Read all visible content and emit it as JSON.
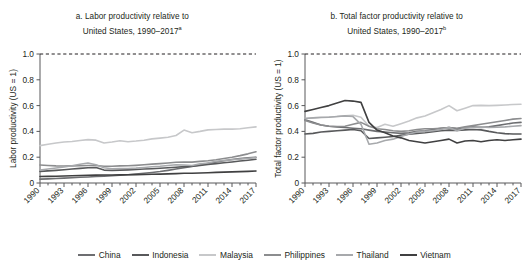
{
  "figure": {
    "background": "#ffffff",
    "axis_color": "#58595b",
    "reference_line_label": "US = 1 reference (dashed at 1.0)"
  },
  "legend": {
    "position": "bottom-center",
    "items": [
      {
        "label": "China",
        "color": "#6d6e71"
      },
      {
        "label": "Indonesia",
        "color": "#58595b"
      },
      {
        "label": "Malaysia",
        "color": "#c7c8ca"
      },
      {
        "label": "Philippines",
        "color": "#8c8d8f"
      },
      {
        "label": "Thailand",
        "color": "#a7a9ac"
      },
      {
        "label": "Vietnam",
        "color": "#404041"
      }
    ]
  },
  "chart_data": [
    {
      "type": "line",
      "panel": "a",
      "title": "a. Labor productivity relative to United States, 1990–2017",
      "title_line1": "a. Labor productivity relative to",
      "title_line2": "United States, 1990–2017",
      "footnote_marker": "a",
      "xlabel": "",
      "ylabel": "Labor productivity (US = 1)",
      "ylim": [
        0,
        1.0
      ],
      "yticks": [
        0,
        0.2,
        0.4,
        0.6,
        0.8,
        1.0
      ],
      "ytick_labels": [
        "0",
        "0.2",
        "0.4",
        "0.6",
        "0.8",
        "1.0"
      ],
      "xlim": [
        1990,
        2017
      ],
      "xticks": [
        1990,
        1993,
        1996,
        1999,
        2002,
        2005,
        2008,
        2011,
        2014,
        2017
      ],
      "xtick_labels": [
        "1990",
        "1993",
        "1996",
        "1999",
        "2002",
        "2005",
        "2008",
        "2011",
        "2014",
        "2017"
      ],
      "grid": false,
      "reference_line": {
        "value": 1.0,
        "style": "dashed",
        "color": "#231f20"
      },
      "x": [
        1990,
        1991,
        1992,
        1993,
        1994,
        1995,
        1996,
        1997,
        1998,
        1999,
        2000,
        2001,
        2002,
        2003,
        2004,
        2005,
        2006,
        2007,
        2008,
        2009,
        2010,
        2011,
        2012,
        2013,
        2014,
        2015,
        2016,
        2017
      ],
      "series": [
        {
          "name": "China",
          "color": "#6d6e71",
          "values": [
            0.03,
            0.032,
            0.035,
            0.038,
            0.041,
            0.044,
            0.047,
            0.05,
            0.053,
            0.056,
            0.06,
            0.064,
            0.069,
            0.075,
            0.082,
            0.089,
            0.098,
            0.108,
            0.118,
            0.128,
            0.14,
            0.152,
            0.163,
            0.173,
            0.182,
            0.189,
            0.195,
            0.2
          ]
        },
        {
          "name": "Indonesia",
          "color": "#58595b",
          "values": [
            0.09,
            0.094,
            0.098,
            0.103,
            0.108,
            0.113,
            0.118,
            0.12,
            0.1,
            0.098,
            0.1,
            0.102,
            0.105,
            0.108,
            0.111,
            0.114,
            0.118,
            0.122,
            0.127,
            0.131,
            0.137,
            0.143,
            0.15,
            0.157,
            0.163,
            0.17,
            0.177,
            0.184
          ]
        },
        {
          "name": "Malaysia",
          "color": "#c7c8ca",
          "values": [
            0.29,
            0.3,
            0.31,
            0.318,
            0.322,
            0.33,
            0.336,
            0.332,
            0.31,
            0.318,
            0.328,
            0.32,
            0.325,
            0.332,
            0.342,
            0.348,
            0.355,
            0.368,
            0.41,
            0.39,
            0.4,
            0.412,
            0.415,
            0.418,
            0.418,
            0.42,
            0.428,
            0.435
          ]
        },
        {
          "name": "Philippines",
          "color": "#8c8d8f",
          "values": [
            0.14,
            0.136,
            0.133,
            0.132,
            0.133,
            0.134,
            0.136,
            0.136,
            0.13,
            0.13,
            0.133,
            0.134,
            0.137,
            0.141,
            0.146,
            0.15,
            0.155,
            0.161,
            0.163,
            0.162,
            0.168,
            0.172,
            0.18,
            0.19,
            0.2,
            0.212,
            0.226,
            0.242
          ]
        },
        {
          "name": "Thailand",
          "color": "#a7a9ac",
          "values": [
            0.1,
            0.108,
            0.116,
            0.124,
            0.134,
            0.145,
            0.155,
            0.142,
            0.118,
            0.11,
            0.112,
            0.112,
            0.115,
            0.12,
            0.126,
            0.13,
            0.136,
            0.142,
            0.14,
            0.136,
            0.148,
            0.155,
            0.168,
            0.175,
            0.18,
            0.186,
            0.192,
            0.198
          ]
        },
        {
          "name": "Vietnam",
          "color": "#404041",
          "values": [
            0.05,
            0.051,
            0.052,
            0.054,
            0.056,
            0.058,
            0.06,
            0.061,
            0.062,
            0.062,
            0.063,
            0.064,
            0.065,
            0.066,
            0.068,
            0.069,
            0.071,
            0.073,
            0.075,
            0.076,
            0.078,
            0.08,
            0.082,
            0.084,
            0.086,
            0.088,
            0.09,
            0.093
          ]
        }
      ]
    },
    {
      "type": "line",
      "panel": "b",
      "title": "b. Total factor productivity relative to United States, 1990–2017",
      "title_line1": "b. Total factor productivity relative to",
      "title_line2": "United States, 1990–2017",
      "footnote_marker": "b",
      "xlabel": "",
      "ylabel": "Total factor productivity (US = 1)",
      "ylim": [
        0,
        1.0
      ],
      "yticks": [
        0,
        0.2,
        0.4,
        0.6,
        0.8,
        1.0
      ],
      "ytick_labels": [
        "0",
        "0.2",
        "0.4",
        "0.6",
        "0.8",
        "1.0"
      ],
      "xlim": [
        1990,
        2017
      ],
      "xticks": [
        1990,
        1993,
        1996,
        1999,
        2002,
        2005,
        2008,
        2011,
        2014,
        2017
      ],
      "xtick_labels": [
        "1990",
        "1993",
        "1996",
        "1999",
        "2002",
        "2005",
        "2008",
        "2011",
        "2014",
        "2017"
      ],
      "grid": false,
      "reference_line": {
        "value": 1.0,
        "style": "dashed",
        "color": "#231f20"
      },
      "x": [
        1990,
        1991,
        1992,
        1993,
        1994,
        1995,
        1996,
        1997,
        1998,
        1999,
        2000,
        2001,
        2002,
        2003,
        2004,
        2005,
        2006,
        2007,
        2008,
        2009,
        2010,
        2011,
        2012,
        2013,
        2014,
        2015,
        2016,
        2017
      ],
      "series": [
        {
          "name": "China",
          "color": "#6d6e71",
          "values": [
            0.49,
            0.47,
            0.45,
            0.44,
            0.435,
            0.43,
            0.425,
            0.42,
            0.41,
            0.4,
            0.395,
            0.39,
            0.385,
            0.39,
            0.4,
            0.405,
            0.415,
            0.425,
            0.43,
            0.42,
            0.43,
            0.435,
            0.43,
            0.435,
            0.445,
            0.455,
            0.465,
            0.47
          ]
        },
        {
          "name": "Indonesia",
          "color": "#58595b",
          "values": [
            0.38,
            0.385,
            0.395,
            0.4,
            0.405,
            0.41,
            0.415,
            0.405,
            0.345,
            0.35,
            0.355,
            0.36,
            0.37,
            0.378,
            0.385,
            0.39,
            0.398,
            0.405,
            0.41,
            0.408,
            0.412,
            0.415,
            0.412,
            0.4,
            0.39,
            0.383,
            0.38,
            0.38
          ]
        },
        {
          "name": "Malaysia",
          "color": "#c7c8ca",
          "values": [
            0.5,
            0.505,
            0.51,
            0.512,
            0.515,
            0.52,
            0.525,
            0.51,
            0.44,
            0.43,
            0.455,
            0.44,
            0.46,
            0.48,
            0.505,
            0.52,
            0.545,
            0.57,
            0.6,
            0.56,
            0.58,
            0.6,
            0.602,
            0.6,
            0.602,
            0.605,
            0.608,
            0.61
          ]
        },
        {
          "name": "Philippines",
          "color": "#8c8d8f",
          "values": [
            0.485,
            0.465,
            0.45,
            0.44,
            0.438,
            0.44,
            0.455,
            0.47,
            0.44,
            0.42,
            0.415,
            0.405,
            0.4,
            0.405,
            0.415,
            0.42,
            0.42,
            0.425,
            0.43,
            0.425,
            0.435,
            0.445,
            0.455,
            0.465,
            0.475,
            0.485,
            0.495,
            0.5
          ]
        },
        {
          "name": "Thailand",
          "color": "#a7a9ac",
          "values": [
            0.5,
            0.505,
            0.508,
            0.51,
            0.515,
            0.52,
            0.515,
            0.455,
            0.3,
            0.31,
            0.33,
            0.34,
            0.36,
            0.38,
            0.395,
            0.4,
            0.405,
            0.415,
            0.43,
            0.405,
            0.425,
            0.43,
            0.435,
            0.43,
            0.432,
            0.435,
            0.44,
            0.445
          ]
        },
        {
          "name": "Vietnam",
          "color": "#404041",
          "values": [
            0.555,
            0.57,
            0.585,
            0.6,
            0.62,
            0.64,
            0.635,
            0.625,
            0.47,
            0.41,
            0.39,
            0.365,
            0.35,
            0.33,
            0.32,
            0.31,
            0.32,
            0.33,
            0.34,
            0.31,
            0.325,
            0.33,
            0.32,
            0.33,
            0.335,
            0.33,
            0.335,
            0.34
          ]
        }
      ]
    }
  ]
}
